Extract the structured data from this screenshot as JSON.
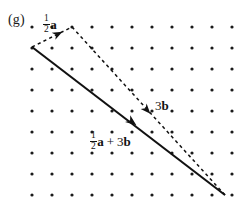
{
  "figure": {
    "panel_label": "(g)",
    "background_color": "#ffffff",
    "ink_color": "#111111",
    "width": 247,
    "height": 216
  },
  "grid": {
    "type": "dot-lattice",
    "columns": 11,
    "rows": 9,
    "origin_x": 32,
    "origin_y": 27,
    "spacing_x": 20,
    "spacing_y": 21,
    "dot_radius": 1.6,
    "dot_color": "#1a1a1a"
  },
  "labels": {
    "half_a": {
      "numerator": "1",
      "denominator": "2",
      "vector": "a"
    },
    "three_b": {
      "scalar": "3",
      "vector": "b"
    },
    "sum": {
      "numerator": "1",
      "denominator": "2",
      "vector_a": "a",
      "plus": "+",
      "scalar_b": "3",
      "vector_b": "b"
    }
  },
  "chart_data": {
    "type": "scatter",
    "xlabel": "",
    "ylabel": "",
    "xlim": [
      0,
      10
    ],
    "ylim": [
      0,
      8
    ],
    "grid": "dot lattice, 11 columns x 9 rows",
    "legend": "none",
    "vectors": [
      {
        "name": "half-a",
        "label": "1/2 a",
        "style": "dashed",
        "start_px": [
          32,
          47
        ],
        "end_px": [
          72,
          27
        ],
        "start_grid": [
          0,
          7
        ],
        "end_grid": [
          2,
          8
        ],
        "arrow_at_px": [
          58,
          34
        ],
        "components_grid": [
          2,
          1
        ]
      },
      {
        "name": "three-b",
        "label": "3b",
        "style": "dashed",
        "start_px": [
          72,
          27
        ],
        "end_px": [
          225,
          195
        ],
        "start_grid": [
          2,
          8
        ],
        "end_grid": [
          9.65,
          0
        ],
        "arrow_at_px": [
          147,
          110
        ],
        "components_grid": [
          7.65,
          -8
        ]
      },
      {
        "name": "half-a-plus-three-b",
        "label": "1/2 a + 3b",
        "style": "solid",
        "start_px": [
          32,
          47
        ],
        "end_px": [
          225,
          195
        ],
        "start_grid": [
          0,
          7
        ],
        "end_grid": [
          9.65,
          0
        ],
        "arrow_at_px": [
          132,
          122
        ],
        "components_grid": [
          9.65,
          -7
        ]
      }
    ]
  }
}
